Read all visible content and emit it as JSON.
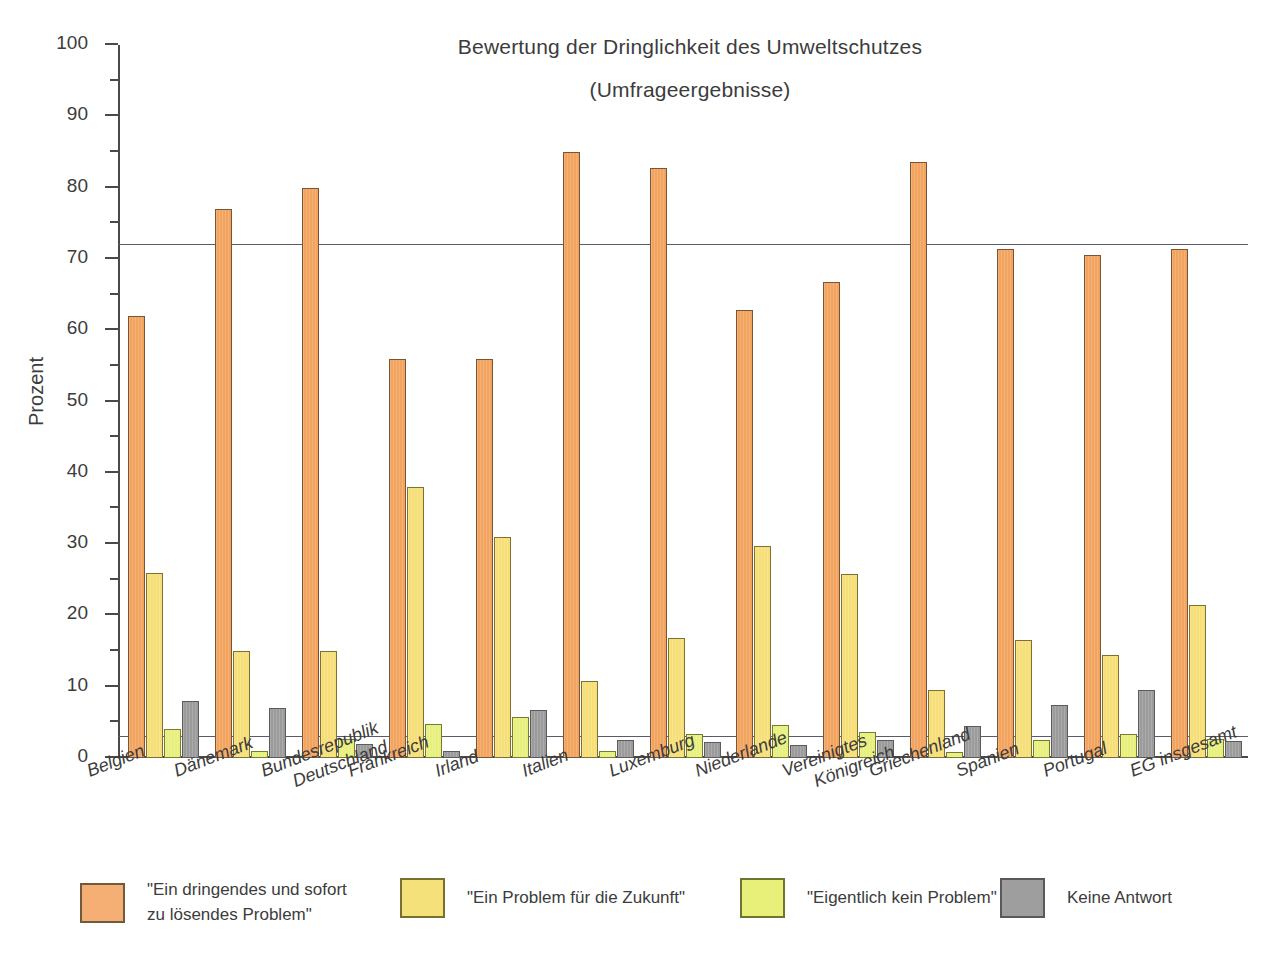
{
  "chart_data": {
    "type": "bar",
    "title": "Bewertung der Dringlichkeit des Umweltschutzes",
    "subtitle": "(Umfrageergebnisse)",
    "xlabel": "",
    "ylabel": "Prozent",
    "ylim": [
      0,
      100
    ],
    "ytick_step": 10,
    "yminor_step": 5,
    "grid": false,
    "legend_position": "bottom",
    "reference_lines": [
      72,
      3
    ],
    "ytick_labels": [
      "0",
      "10",
      "20",
      "30",
      "40",
      "50",
      "60",
      "70",
      "80",
      "90",
      "100"
    ],
    "categories": [
      "Belgien",
      "Dänemark",
      "Bundesrepublik Deutschland",
      "Frankreich",
      "Irland",
      "Italien",
      "Luxemburg",
      "Niederlande",
      "Vereinigtes Königreich",
      "Griechenland",
      "Spanien",
      "Portugal",
      "EG insgesamt"
    ],
    "category_lines": [
      [
        "Belgien",
        ""
      ],
      [
        "Dänemark",
        ""
      ],
      [
        "Bundesrepublik",
        "Deutschland"
      ],
      [
        "Frankreich",
        ""
      ],
      [
        "Irland",
        ""
      ],
      [
        "Italien",
        ""
      ],
      [
        "Luxemburg",
        ""
      ],
      [
        "Niederlande",
        ""
      ],
      [
        "Vereinigtes",
        "Königreich"
      ],
      [
        "Griechenland",
        ""
      ],
      [
        "Spanien",
        ""
      ],
      [
        "Portugal",
        ""
      ],
      [
        "EG insgesamt",
        ""
      ]
    ],
    "series": [
      {
        "name": "\"Ein dringendes und sofort zu lösendes Problem\"",
        "color": "#f2a45f",
        "values": [
          62.0,
          77.0,
          80.0,
          56.0,
          56.0,
          85.0,
          82.8,
          62.8,
          66.7,
          83.6,
          71.4,
          70.6,
          71.4
        ]
      },
      {
        "name": "\"Ein Problem für die Zukunft\"",
        "color": "#f7df78",
        "values": [
          26.0,
          15.0,
          15.0,
          38.0,
          31.0,
          10.8,
          16.8,
          29.8,
          25.8,
          9.6,
          16.6,
          14.5,
          21.5
        ]
      },
      {
        "name": "\"Eigentlich kein Problem\"",
        "color": "#e7f07c",
        "values": [
          4.0,
          1.0,
          2.7,
          4.8,
          5.8,
          1.0,
          3.4,
          4.7,
          3.7,
          0.8,
          2.5,
          3.4,
          2.6
        ]
      },
      {
        "name": "Keine Antwort",
        "color": "#9b9b9b",
        "values": [
          8.0,
          7.0,
          2.0,
          1.0,
          6.8,
          2.5,
          2.3,
          1.8,
          2.5,
          4.5,
          7.4,
          9.5,
          2.4
        ]
      }
    ]
  },
  "legend": {
    "items": [
      {
        "label": "\"Ein dringendes und sofort\nzu lösendes Problem\"",
        "color": "#f5ae74",
        "swatch_name": "legend-swatch-urgent"
      },
      {
        "label": "\"Ein Problem für die Zukunft\"",
        "color": "#f5e17a",
        "swatch_name": "legend-swatch-future"
      },
      {
        "label": "\"Eigentlich kein Problem\"",
        "color": "#e8f07a",
        "swatch_name": "legend-swatch-noproblem"
      },
      {
        "label": "Keine Antwort",
        "color": "#9e9e9e",
        "swatch_name": "legend-swatch-noanswer"
      }
    ]
  },
  "colors": {
    "series_urgent": "#f2a45f",
    "series_future": "#f7df78",
    "series_no_problem": "#e7f07c",
    "series_no_answer": "#9b9b9b",
    "axis": "#4a4a4a",
    "text": "#3c3c3c",
    "background": "#ffffff"
  }
}
